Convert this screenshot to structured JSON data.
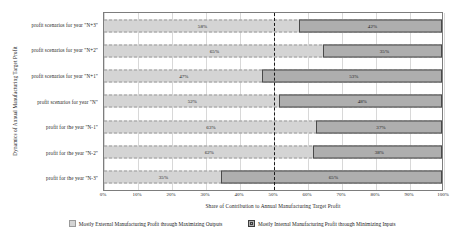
{
  "chart_data": {
    "type": "bar",
    "orientation": "horizontal",
    "title": "",
    "xlabel": "Share of Contribution to Annual Manufacturing Target Profit",
    "ylabel": "Dynamics of Annual Manufacturing Target Profit",
    "xlim": [
      0,
      100
    ],
    "grid": true,
    "legend_position": "bottom",
    "reference_line": {
      "value": 50,
      "style": "dashed",
      "color": "#1a1a1a"
    },
    "xticks": [
      "0%",
      "10%",
      "20%",
      "30%",
      "40%",
      "50%",
      "60%",
      "70%",
      "80%",
      "90%",
      "100%"
    ],
    "xtick_values": [
      0,
      10,
      20,
      30,
      40,
      50,
      60,
      70,
      80,
      90,
      100
    ],
    "categories": [
      "profit scenarios for year \"N+3\"",
      "profit scenarios for year \"N+2\"",
      "profit scenarios for year \"N+1\"",
      "profit scenarios for year \"N\"",
      "profit for the year \"N-1\"",
      "profit for the year \"N-2\"",
      "profit for the year \"N-3\""
    ],
    "series": [
      {
        "name": "Mostly External Manufacturing Profit through Maximizing Outputs",
        "color": "#d4d4d4",
        "values": [
          58,
          65,
          47,
          52,
          63,
          62,
          35
        ],
        "labels": [
          "58%",
          "65%",
          "47%",
          "52%",
          "63%",
          "62%",
          "35%"
        ]
      },
      {
        "name": "Mostly Internal Manufacturing Profit through Minimizing Inputs",
        "color": "#aeaeae",
        "values": [
          42,
          35,
          53,
          48,
          37,
          38,
          65
        ],
        "labels": [
          "42%",
          "35%",
          "53%",
          "48%",
          "37%",
          "38%",
          "65%"
        ]
      }
    ]
  },
  "legend": {
    "items": [
      {
        "label": "Mostly External Manufacturing Profit through Maximizing Outputs"
      },
      {
        "label": "Mostly Internal Manufacturing Profit through Minimizing Inputs"
      }
    ]
  }
}
